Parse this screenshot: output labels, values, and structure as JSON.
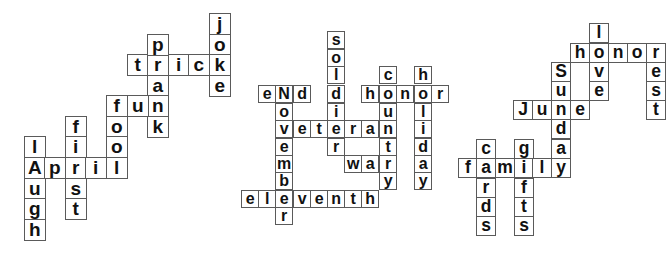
{
  "puzzles": [
    {
      "theme": "April Fools",
      "cell_size": 20.6,
      "origin": [
        24,
        13
      ],
      "words": [
        {
          "word": "joke",
          "dir": "down"
        },
        {
          "word": "trick",
          "dir": "across"
        },
        {
          "word": "prank",
          "dir": "down"
        },
        {
          "word": "fun",
          "dir": "across"
        },
        {
          "word": "fool",
          "dir": "down"
        },
        {
          "word": "April",
          "dir": "across"
        },
        {
          "word": "first",
          "dir": "down"
        },
        {
          "word": "lAugh",
          "dir": "down"
        }
      ],
      "cells": [
        {
          "x": 209,
          "y": 13,
          "ch": "j"
        },
        {
          "x": 209,
          "y": 34,
          "ch": "o"
        },
        {
          "x": 209,
          "y": 54,
          "ch": "k"
        },
        {
          "x": 209,
          "y": 75,
          "ch": "e"
        },
        {
          "x": 127,
          "y": 54,
          "ch": "t"
        },
        {
          "x": 147,
          "y": 54,
          "ch": "r"
        },
        {
          "x": 168,
          "y": 54,
          "ch": "i"
        },
        {
          "x": 188,
          "y": 54,
          "ch": "c"
        },
        {
          "x": 147,
          "y": 34,
          "ch": "p"
        },
        {
          "x": 147,
          "y": 75,
          "ch": "a"
        },
        {
          "x": 147,
          "y": 95,
          "ch": "n"
        },
        {
          "x": 147,
          "y": 116,
          "ch": "k"
        },
        {
          "x": 106,
          "y": 95,
          "ch": "f"
        },
        {
          "x": 127,
          "y": 95,
          "ch": "u"
        },
        {
          "x": 106,
          "y": 116,
          "ch": "o"
        },
        {
          "x": 106,
          "y": 136,
          "ch": "o"
        },
        {
          "x": 106,
          "y": 157,
          "ch": "l"
        },
        {
          "x": 24,
          "y": 157,
          "ch": "A"
        },
        {
          "x": 44,
          "y": 157,
          "ch": "p"
        },
        {
          "x": 65,
          "y": 157,
          "ch": "r"
        },
        {
          "x": 85,
          "y": 157,
          "ch": "i"
        },
        {
          "x": 65,
          "y": 116,
          "ch": "f"
        },
        {
          "x": 65,
          "y": 136,
          "ch": "i"
        },
        {
          "x": 65,
          "y": 178,
          "ch": "s"
        },
        {
          "x": 65,
          "y": 198,
          "ch": "t"
        },
        {
          "x": 24,
          "y": 136,
          "ch": "l"
        },
        {
          "x": 24,
          "y": 178,
          "ch": "u"
        },
        {
          "x": 24,
          "y": 198,
          "ch": "g"
        },
        {
          "x": 24,
          "y": 219,
          "ch": "h"
        }
      ]
    },
    {
      "theme": "Veterans Day",
      "words": [
        {
          "word": "eNd",
          "dir": "across"
        },
        {
          "word": "November",
          "dir": "down"
        },
        {
          "word": "veteran",
          "dir": "across"
        },
        {
          "word": "soldier",
          "dir": "down"
        },
        {
          "word": "honor",
          "dir": "across"
        },
        {
          "word": "country",
          "dir": "down"
        },
        {
          "word": "holiday",
          "dir": "down"
        },
        {
          "word": "war",
          "dir": "across"
        },
        {
          "word": "eleventh",
          "dir": "across"
        }
      ],
      "cells": [
        {
          "x": 258,
          "y": 85,
          "ch": "e"
        },
        {
          "x": 275,
          "y": 85,
          "ch": "N"
        },
        {
          "x": 293,
          "y": 85,
          "ch": "d"
        },
        {
          "x": 275,
          "y": 103,
          "ch": "o"
        },
        {
          "x": 275,
          "y": 120,
          "ch": "v"
        },
        {
          "x": 293,
          "y": 120,
          "ch": "e"
        },
        {
          "x": 310,
          "y": 120,
          "ch": "t"
        },
        {
          "x": 327,
          "y": 120,
          "ch": "e"
        },
        {
          "x": 344,
          "y": 120,
          "ch": "r"
        },
        {
          "x": 361,
          "y": 120,
          "ch": "a"
        },
        {
          "x": 379,
          "y": 120,
          "ch": "n"
        },
        {
          "x": 275,
          "y": 138,
          "ch": "e"
        },
        {
          "x": 275,
          "y": 155,
          "ch": "m"
        },
        {
          "x": 275,
          "y": 172,
          "ch": "b"
        },
        {
          "x": 275,
          "y": 190,
          "ch": "e"
        },
        {
          "x": 275,
          "y": 207,
          "ch": "r"
        },
        {
          "x": 327,
          "y": 31,
          "ch": "s"
        },
        {
          "x": 327,
          "y": 49,
          "ch": "o"
        },
        {
          "x": 327,
          "y": 66,
          "ch": "l"
        },
        {
          "x": 327,
          "y": 85,
          "ch": "d"
        },
        {
          "x": 327,
          "y": 103,
          "ch": "i"
        },
        {
          "x": 327,
          "y": 138,
          "ch": "r"
        },
        {
          "x": 361,
          "y": 85,
          "ch": "h"
        },
        {
          "x": 379,
          "y": 85,
          "ch": "o"
        },
        {
          "x": 396,
          "y": 85,
          "ch": "n"
        },
        {
          "x": 414,
          "y": 85,
          "ch": "o"
        },
        {
          "x": 431,
          "y": 85,
          "ch": "r"
        },
        {
          "x": 379,
          "y": 66,
          "ch": "c"
        },
        {
          "x": 379,
          "y": 103,
          "ch": "u"
        },
        {
          "x": 379,
          "y": 138,
          "ch": "t"
        },
        {
          "x": 379,
          "y": 155,
          "ch": "r"
        },
        {
          "x": 379,
          "y": 172,
          "ch": "y"
        },
        {
          "x": 344,
          "y": 155,
          "ch": "w"
        },
        {
          "x": 361,
          "y": 155,
          "ch": "a"
        },
        {
          "x": 414,
          "y": 66,
          "ch": "h"
        },
        {
          "x": 414,
          "y": 103,
          "ch": "l"
        },
        {
          "x": 414,
          "y": 120,
          "ch": "i"
        },
        {
          "x": 414,
          "y": 138,
          "ch": "d"
        },
        {
          "x": 414,
          "y": 155,
          "ch": "a"
        },
        {
          "x": 414,
          "y": 172,
          "ch": "y"
        },
        {
          "x": 241,
          "y": 190,
          "ch": "e"
        },
        {
          "x": 258,
          "y": 190,
          "ch": "l"
        },
        {
          "x": 293,
          "y": 190,
          "ch": "v"
        },
        {
          "x": 310,
          "y": 190,
          "ch": "e"
        },
        {
          "x": 327,
          "y": 190,
          "ch": "n"
        },
        {
          "x": 344,
          "y": 190,
          "ch": "t"
        },
        {
          "x": 361,
          "y": 190,
          "ch": "h"
        }
      ]
    },
    {
      "theme": "Father's Day",
      "words": [
        {
          "word": "love",
          "dir": "down"
        },
        {
          "word": "honor",
          "dir": "across"
        },
        {
          "word": "rest",
          "dir": "down"
        },
        {
          "word": "Sunday",
          "dir": "down"
        },
        {
          "word": "June",
          "dir": "across"
        },
        {
          "word": "family",
          "dir": "across"
        },
        {
          "word": "cards",
          "dir": "down"
        },
        {
          "word": "gifts",
          "dir": "down"
        }
      ],
      "cells": [
        {
          "x": 589,
          "y": 23,
          "ch": "l"
        },
        {
          "x": 589,
          "y": 43,
          "ch": "o"
        },
        {
          "x": 589,
          "y": 62,
          "ch": "v"
        },
        {
          "x": 589,
          "y": 81,
          "ch": "e"
        },
        {
          "x": 570,
          "y": 43,
          "ch": "h"
        },
        {
          "x": 608,
          "y": 43,
          "ch": "n"
        },
        {
          "x": 627,
          "y": 43,
          "ch": "o"
        },
        {
          "x": 646,
          "y": 43,
          "ch": "r"
        },
        {
          "x": 646,
          "y": 62,
          "ch": "e"
        },
        {
          "x": 646,
          "y": 81,
          "ch": "s"
        },
        {
          "x": 646,
          "y": 100,
          "ch": "t"
        },
        {
          "x": 551,
          "y": 62,
          "ch": "S"
        },
        {
          "x": 551,
          "y": 81,
          "ch": "u"
        },
        {
          "x": 551,
          "y": 100,
          "ch": "n"
        },
        {
          "x": 551,
          "y": 119,
          "ch": "d"
        },
        {
          "x": 551,
          "y": 139,
          "ch": "a"
        },
        {
          "x": 551,
          "y": 158,
          "ch": "y"
        },
        {
          "x": 513,
          "y": 100,
          "ch": "J"
        },
        {
          "x": 532,
          "y": 100,
          "ch": "u"
        },
        {
          "x": 570,
          "y": 100,
          "ch": "e"
        },
        {
          "x": 458,
          "y": 158,
          "ch": "f"
        },
        {
          "x": 476,
          "y": 158,
          "ch": "a"
        },
        {
          "x": 495,
          "y": 158,
          "ch": "m"
        },
        {
          "x": 514,
          "y": 158,
          "ch": "i"
        },
        {
          "x": 532,
          "y": 158,
          "ch": "l"
        },
        {
          "x": 476,
          "y": 139,
          "ch": "c"
        },
        {
          "x": 476,
          "y": 178,
          "ch": "r"
        },
        {
          "x": 476,
          "y": 197,
          "ch": "d"
        },
        {
          "x": 476,
          "y": 216,
          "ch": "s"
        },
        {
          "x": 514,
          "y": 139,
          "ch": "g"
        },
        {
          "x": 514,
          "y": 178,
          "ch": "f"
        },
        {
          "x": 514,
          "y": 197,
          "ch": "t"
        },
        {
          "x": 514,
          "y": 216,
          "ch": "s"
        }
      ]
    }
  ]
}
